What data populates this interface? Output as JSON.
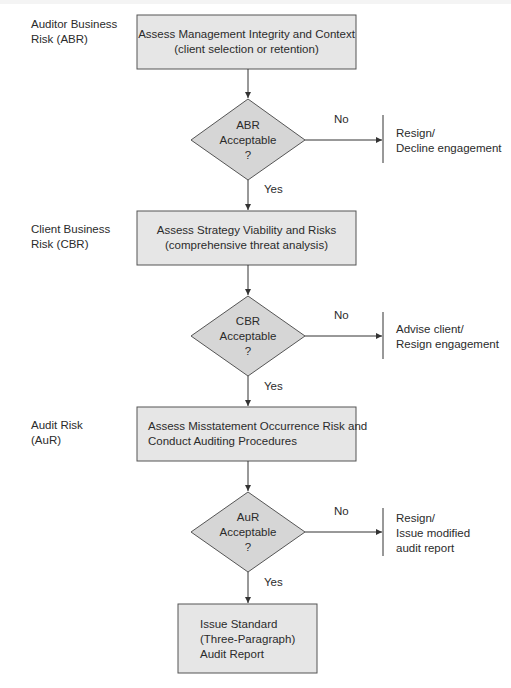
{
  "colors": {
    "box_fill": "#e6e6e6",
    "diamond_fill": "#d6d6d6",
    "stroke": "#555555",
    "line": "#333333",
    "text": "#2b2b2b"
  },
  "stages": [
    {
      "risk_label_line1": "Auditor Business",
      "risk_label_line2": "Risk (ABR)",
      "process_line1": "Assess Management Integrity and Context",
      "process_line2": "(client selection or retention)",
      "decision_line1": "ABR",
      "decision_line2": "Acceptable",
      "decision_line3": "?",
      "no_label": "No",
      "yes_label": "Yes",
      "outcome_line1": "Resign/",
      "outcome_line2": "Decline engagement"
    },
    {
      "risk_label_line1": "Client Business",
      "risk_label_line2": "Risk (CBR)",
      "process_line1": "Assess Strategy Viability and Risks",
      "process_line2": "(comprehensive threat analysis)",
      "decision_line1": "CBR",
      "decision_line2": "Acceptable",
      "decision_line3": "?",
      "no_label": "No",
      "yes_label": "Yes",
      "outcome_line1": "Advise client/",
      "outcome_line2": "Resign engagement"
    },
    {
      "risk_label_line1": "Audit Risk",
      "risk_label_line2": "(AuR)",
      "process_line1": "Assess Misstatement Occurrence Risk and",
      "process_line2": "Conduct Auditing Procedures",
      "decision_line1": "AuR",
      "decision_line2": "Acceptable",
      "decision_line3": "?",
      "no_label": "No",
      "yes_label": "Yes",
      "outcome_line1": "Resign/",
      "outcome_line2": "Issue modified",
      "outcome_line3": "audit report"
    }
  ],
  "final": {
    "line1": "Issue Standard",
    "line2": "(Three-Paragraph)",
    "line3": "Audit Report"
  }
}
